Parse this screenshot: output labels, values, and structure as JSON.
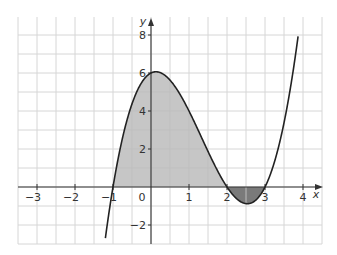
{
  "chart_data": {
    "type": "line",
    "title": "",
    "function": "y = (x+1)(x-2)(x-3)",
    "xlabel": "x",
    "ylabel": "y",
    "xlim": [
      -3.5,
      4.5
    ],
    "ylim": [
      -3,
      9
    ],
    "grid": true,
    "x_ticks": [
      -3,
      -2,
      -1,
      0,
      1,
      2,
      3,
      4
    ],
    "x_tick_labels": [
      "−3",
      "−2",
      "−1",
      "0",
      "1",
      "2",
      "3",
      "4"
    ],
    "y_ticks": [
      -2,
      2,
      4,
      6,
      8
    ],
    "y_tick_labels": [
      "−2",
      "2",
      "4",
      "6",
      "8"
    ],
    "roots": [
      -1,
      2,
      3
    ],
    "points": [
      {
        "x": -1.17,
        "y": -3
      },
      {
        "x": -1,
        "y": 0
      },
      {
        "x": -0.5,
        "y": 4.375
      },
      {
        "x": 0,
        "y": 6
      },
      {
        "x": 0.14,
        "y": 6.06
      },
      {
        "x": 0.5,
        "y": 5.625
      },
      {
        "x": 1,
        "y": 4
      },
      {
        "x": 1.5,
        "y": 1.875
      },
      {
        "x": 2,
        "y": 0
      },
      {
        "x": 2.5,
        "y": -0.875
      },
      {
        "x": 3,
        "y": 0
      },
      {
        "x": 3.5,
        "y": 3.375
      },
      {
        "x": 3.87,
        "y": 8
      }
    ],
    "shaded_regions": [
      {
        "name": "area above x-axis",
        "from": -1,
        "to": 2,
        "color": "#c6c6c6"
      },
      {
        "name": "area below x-axis",
        "from": 2,
        "to": 3,
        "color": "#7a7a7a"
      }
    ]
  },
  "colors": {
    "grid": "#d6d6d6",
    "axis": "#333333",
    "curve": "#222222",
    "shade_light": "#c6c6c6",
    "shade_dark": "#7a7a7a"
  }
}
